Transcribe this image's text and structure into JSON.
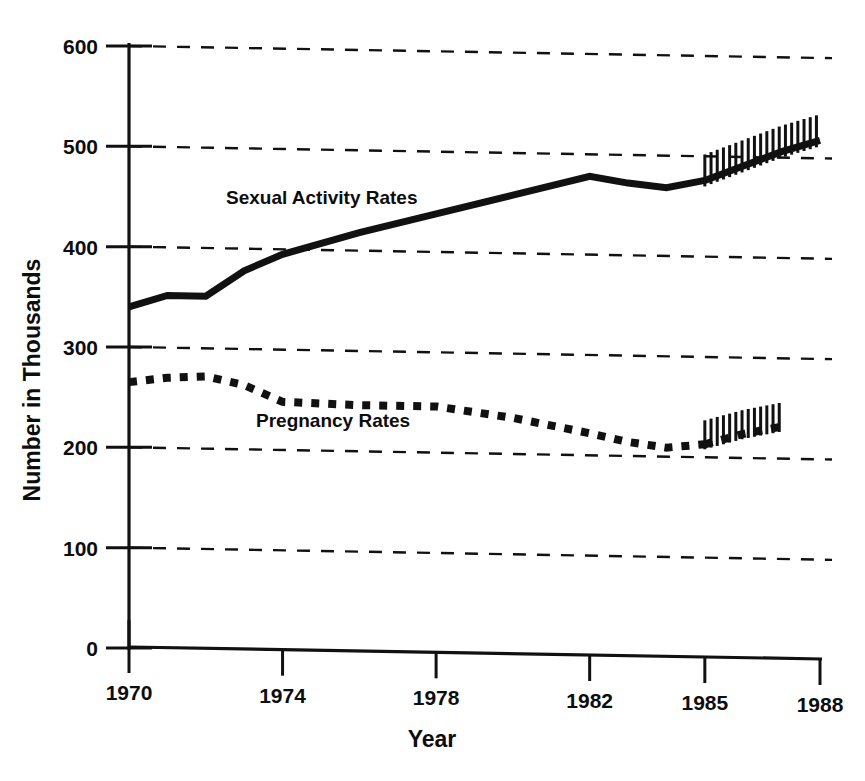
{
  "chart_data": {
    "type": "line",
    "title": "",
    "xlabel": "Year",
    "ylabel": "Number in Thousands",
    "xlim": [
      1970,
      1988
    ],
    "ylim": [
      0,
      600
    ],
    "grid": true,
    "legend_position": "inline-labels",
    "x_ticks": [
      "1970",
      "1974",
      "1978",
      "1982",
      "1985",
      "1988"
    ],
    "x_tick_values": [
      1970,
      1974,
      1978,
      1982,
      1985,
      1988
    ],
    "y_ticks": [
      "0",
      "100",
      "200",
      "300",
      "400",
      "500",
      "600"
    ],
    "y_tick_values": [
      0,
      100,
      200,
      300,
      400,
      500,
      600
    ],
    "series": [
      {
        "name": "Sexual Activity Rates",
        "style": "solid",
        "label_text": "Sexual Activity Rates",
        "x": [
          1970,
          1971,
          1972,
          1973,
          1974,
          1976,
          1978,
          1980,
          1982,
          1983,
          1984,
          1985
        ],
        "values": [
          340,
          352,
          352,
          378,
          395,
          418,
          438,
          458,
          478,
          472,
          468,
          476
        ],
        "projection": {
          "note": "hatched projected segment",
          "x": [
            1985,
            1986,
            1987,
            1988
          ],
          "values": [
            476,
            491,
            506,
            518
          ]
        }
      },
      {
        "name": "Pregnancy Rates",
        "style": "dotted",
        "label_text": "Pregnancy Rates",
        "x": [
          1970,
          1971,
          1972,
          1973,
          1974,
          1976,
          1978,
          1980,
          1982,
          1983,
          1984,
          1985
        ],
        "values": [
          265,
          270,
          272,
          264,
          248,
          246,
          246,
          236,
          222,
          214,
          209,
          213
        ],
        "projection": {
          "note": "hatched projected segment",
          "x": [
            1985,
            1986,
            1987
          ],
          "values": [
            213,
            224,
            232
          ]
        }
      }
    ]
  },
  "axes": {
    "y_title": "Number in Thousands",
    "x_title": "Year"
  },
  "labels": {
    "series_one": "Sexual Activity Rates",
    "series_two": "Pregnancy Rates"
  },
  "colors": {
    "ink": "#111111",
    "background": "#ffffff"
  }
}
